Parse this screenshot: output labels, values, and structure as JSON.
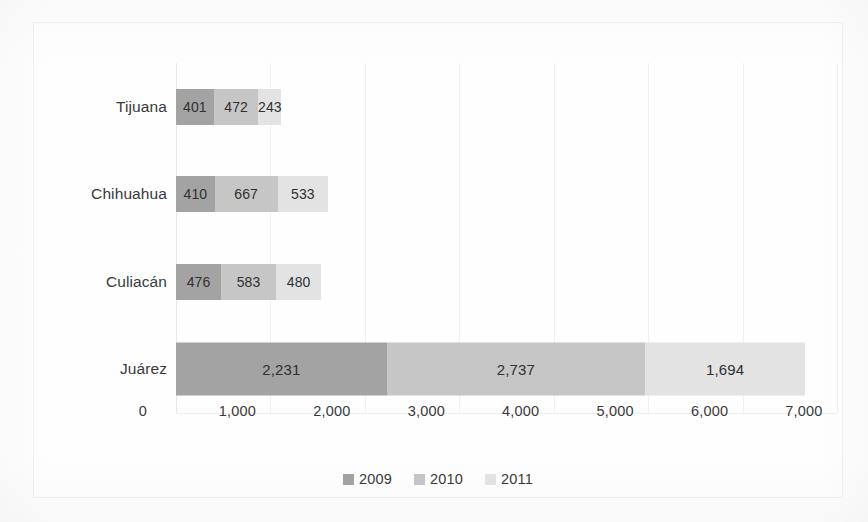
{
  "chart_data": {
    "type": "bar",
    "orientation": "horizontal",
    "stacked": true,
    "title": "",
    "subtitle": "",
    "xlabel": "",
    "ylabel": "",
    "categories": [
      "Tijuana",
      "Chihuahua",
      "Culiacán",
      "Juárez"
    ],
    "series": [
      {
        "name": "2009",
        "color": "#a3a3a3",
        "values": [
          401,
          410,
          476,
          2231
        ],
        "labels": [
          "401",
          "410",
          "476",
          "2,231"
        ]
      },
      {
        "name": "2010",
        "color": "#c6c6c6",
        "values": [
          472,
          667,
          583,
          2737
        ],
        "labels": [
          "472",
          "667",
          "583",
          "2,737"
        ]
      },
      {
        "name": "2011",
        "color": "#e3e3e3",
        "values": [
          243,
          533,
          480,
          1694
        ],
        "labels": [
          "243",
          "533",
          "480",
          "1,694"
        ]
      }
    ],
    "totals": [
      1116,
      1610,
      1539,
      6662
    ],
    "xlim": [
      0,
      7000
    ],
    "xticks": [
      0,
      1000,
      2000,
      3000,
      4000,
      5000,
      6000,
      7000
    ],
    "xticklabels": [
      "0",
      "1,000",
      "2,000",
      "3,000",
      "4,000",
      "5,000",
      "6,000",
      "7,000"
    ],
    "grid": true,
    "grid_axis": "x",
    "legend_position": "bottom",
    "legend_entries": [
      "2009",
      "2010",
      "2011"
    ]
  },
  "axis": {
    "ticks": [
      {
        "label": "0",
        "value": 0
      },
      {
        "label": "1,000",
        "value": 1000
      },
      {
        "label": "2,000",
        "value": 2000
      },
      {
        "label": "3,000",
        "value": 3000
      },
      {
        "label": "4,000",
        "value": 4000
      },
      {
        "label": "5,000",
        "value": 5000
      },
      {
        "label": "6,000",
        "value": 6000
      },
      {
        "label": "7,000",
        "value": 7000
      }
    ]
  },
  "rows": [
    {
      "category": "Tijuana",
      "segments": [
        {
          "series": "2009",
          "label": "401",
          "value": 401
        },
        {
          "series": "2010",
          "label": "472",
          "value": 472
        },
        {
          "series": "2011",
          "label": "243",
          "value": 243
        }
      ]
    },
    {
      "category": "Chihuahua",
      "segments": [
        {
          "series": "2009",
          "label": "410",
          "value": 410
        },
        {
          "series": "2010",
          "label": "667",
          "value": 667
        },
        {
          "series": "2011",
          "label": "533",
          "value": 533
        }
      ]
    },
    {
      "category": "Culiacán",
      "segments": [
        {
          "series": "2009",
          "label": "476",
          "value": 476
        },
        {
          "series": "2010",
          "label": "583",
          "value": 583
        },
        {
          "series": "2011",
          "label": "480",
          "value": 480
        }
      ]
    },
    {
      "category": "Juárez",
      "segments": [
        {
          "series": "2009",
          "label": "2,231",
          "value": 2231
        },
        {
          "series": "2010",
          "label": "2,737",
          "value": 2737
        },
        {
          "series": "2011",
          "label": "1,694",
          "value": 1694
        }
      ]
    }
  ],
  "legend": [
    {
      "label": "2009",
      "color": "#a3a3a3"
    },
    {
      "label": "2010",
      "color": "#c6c6c6"
    },
    {
      "label": "2011",
      "color": "#e3e3e3"
    }
  ],
  "colors": {
    "series_2009": "#a3a3a3",
    "series_2010": "#c6c6c6",
    "series_2011": "#e3e3e3",
    "text": "#3a3a3a",
    "grid": "#f0f0f0",
    "background": "#fefefe"
  }
}
